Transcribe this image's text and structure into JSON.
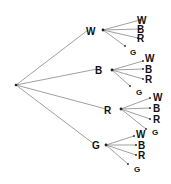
{
  "diagram": {
    "type": "tree",
    "root": {
      "x": 16,
      "y": 85
    },
    "nodes": [
      {
        "label": "W",
        "lx": 92,
        "ly": 31,
        "dx": 103,
        "dy": 30,
        "children": [
          {
            "label": "W",
            "x": 140,
            "y": 20,
            "tx": 137,
            "ty": 20
          },
          {
            "label": "B",
            "x": 140,
            "y": 29,
            "tx": 137,
            "ty": 29
          },
          {
            "label": "R",
            "x": 138,
            "y": 38,
            "tx": 137,
            "ty": 38
          },
          {
            "label": "G",
            "x": 125,
            "y": 46,
            "tx": 130,
            "ty": 51
          }
        ]
      },
      {
        "label": "B",
        "lx": 101,
        "ly": 70,
        "dx": 112,
        "dy": 70,
        "children": [
          {
            "label": "W",
            "x": 143,
            "y": 61,
            "tx": 145,
            "ty": 58
          },
          {
            "label": "B",
            "x": 143,
            "y": 69,
            "tx": 145,
            "ty": 69
          },
          {
            "label": "R",
            "x": 143,
            "y": 79,
            "tx": 145,
            "ty": 79
          },
          {
            "label": "G",
            "x": 130,
            "y": 86,
            "tx": 136,
            "ty": 91
          }
        ]
      },
      {
        "label": "R",
        "lx": 110,
        "ly": 110,
        "dx": 121,
        "dy": 109,
        "children": [
          {
            "label": "W",
            "x": 150,
            "y": 98,
            "tx": 153,
            "ty": 97
          },
          {
            "label": "B",
            "x": 150,
            "y": 108,
            "tx": 153,
            "ty": 108
          },
          {
            "label": "R",
            "x": 150,
            "y": 119,
            "tx": 153,
            "ty": 119
          },
          {
            "label": "G",
            "x": 146,
            "y": 129,
            "tx": 152,
            "ty": 131
          }
        ]
      },
      {
        "label": "G",
        "lx": 98,
        "ly": 145,
        "dx": 106,
        "dy": 145,
        "children": [
          {
            "label": "W",
            "x": 134,
            "y": 136,
            "tx": 136,
            "ty": 134
          },
          {
            "label": "B",
            "x": 136,
            "y": 145,
            "tx": 138,
            "ty": 145
          },
          {
            "label": "R",
            "x": 136,
            "y": 155,
            "tx": 138,
            "ty": 155
          },
          {
            "label": "G",
            "x": 128,
            "y": 164,
            "tx": 134,
            "ty": 168
          }
        ]
      }
    ],
    "colors": {
      "line": "#888888",
      "dot": "#222222",
      "text": "#111111"
    }
  }
}
